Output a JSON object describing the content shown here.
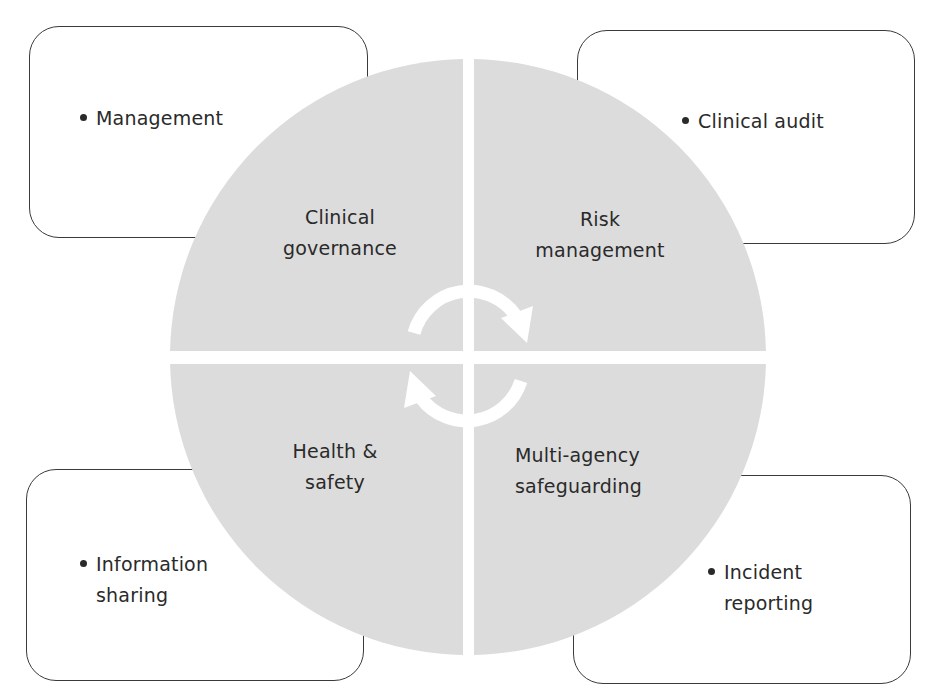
{
  "diagram": {
    "colors": {
      "quadrant_fill": "#dcdcdc",
      "box_border": "#3a3a3a",
      "text": "#2a2a2a",
      "background": "#ffffff",
      "cycle_arrows": "#ffffff"
    },
    "quadrants": [
      {
        "position": "top-left",
        "label_line1": "Clinical",
        "label_line2": "governance"
      },
      {
        "position": "top-right",
        "label_line1": "Risk",
        "label_line2": "management"
      },
      {
        "position": "bottom-left",
        "label_line1": "Health &",
        "label_line2": "safety"
      },
      {
        "position": "bottom-right",
        "label_line1": "Multi-agency",
        "label_line2": "safeguarding"
      }
    ],
    "boxes": [
      {
        "position": "top-left",
        "line1": "Management",
        "line2": ""
      },
      {
        "position": "top-right",
        "line1": "Clinical audit",
        "line2": ""
      },
      {
        "position": "bottom-left",
        "line1": "Information",
        "line2": "sharing"
      },
      {
        "position": "bottom-right",
        "line1": "Incident",
        "line2": "reporting"
      }
    ],
    "center_icon": "cycle-arrows-icon"
  }
}
